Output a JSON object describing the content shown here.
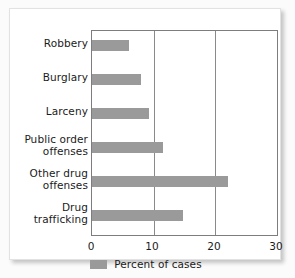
{
  "chart_data": {
    "type": "bar",
    "orientation": "horizontal",
    "title": "",
    "xlabel": "",
    "ylabel": "",
    "categories": [
      "Robbery",
      "Burglary",
      "Larceny",
      "Public order offenses",
      "Other drug offenses",
      "Drug trafficking"
    ],
    "category_lines": [
      [
        "Robbery"
      ],
      [
        "Burglary"
      ],
      [
        "Larceny"
      ],
      [
        "Public order",
        "offenses"
      ],
      [
        "Other drug",
        "offenses"
      ],
      [
        "Drug",
        "trafficking"
      ]
    ],
    "values": [
      6,
      8,
      9.2,
      11.5,
      22,
      14.8
    ],
    "series": [
      {
        "name": "Percent of cases",
        "values": [
          6,
          8,
          9.2,
          11.5,
          22,
          14.8
        ]
      }
    ],
    "xlim": [
      0,
      30
    ],
    "xticks": [
      0,
      10,
      20,
      30
    ],
    "xtick_labels": [
      "0",
      "10",
      "20",
      "30"
    ],
    "grid": "vertical gridlines at 10 and 20",
    "legend": {
      "position": "bottom-center",
      "entries": [
        {
          "label": "Percent of cases",
          "color": "#9a9a9a"
        }
      ]
    },
    "colors": {
      "bar": "#9a9a9a",
      "axis": "#7d7d7d",
      "gridline": "#8a8a8a",
      "text": "#1b1b1b",
      "plot_background": "#ffffff",
      "card_background": "#ffffff",
      "page_background": "#fbfbfb"
    }
  }
}
